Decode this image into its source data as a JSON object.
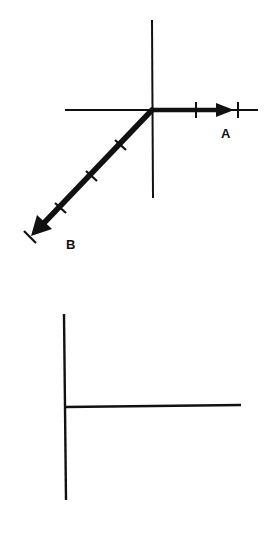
{
  "figure_top": {
    "description": "Coordinate axes with two vectors A and B drawn from the origin",
    "axes": {
      "origin": [
        152,
        110
      ],
      "horizontal": {
        "x1": 65,
        "x2": 258,
        "y": 110
      },
      "vertical": {
        "x": 152,
        "y1": 20,
        "y2": 198
      }
    },
    "vectors": [
      {
        "id": "A",
        "label": "A",
        "direction": "right (0°)",
        "tail": [
          152,
          110
        ],
        "head": [
          233,
          110
        ],
        "tick_marks": [
          [
            196,
            110
          ],
          [
            238,
            110
          ]
        ],
        "label_position": [
          226,
          136
        ]
      },
      {
        "id": "B",
        "label": "B",
        "direction": "down-left (~225°)",
        "tail": [
          152,
          110
        ],
        "head": [
          30,
          237
        ],
        "tick_marks": [
          [
            120,
            145
          ],
          [
            92,
            176
          ],
          [
            60,
            208
          ]
        ],
        "label_position": [
          72,
          247
        ]
      }
    ],
    "color": "#111111"
  },
  "figure_bottom": {
    "description": "Empty axes for drawing the answer (vertical line with horizontal line extending right)",
    "vertical": {
      "x1": 64,
      "y1": 314,
      "x2": 66,
      "y2": 500
    },
    "horizontal": {
      "x1": 65,
      "y": 406,
      "x2": 241
    },
    "color": "#111111"
  }
}
